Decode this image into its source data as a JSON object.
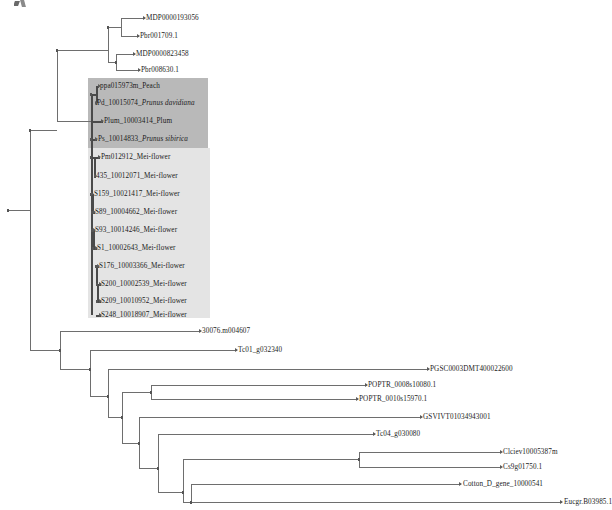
{
  "figure": {
    "kind": "phylogenetic-tree",
    "orientation": "rectangular-cladogram-left-to-right",
    "background": "#ffffff",
    "line_color": "#6e6e6e",
    "highlight_dark": "#b9b9b9",
    "highlight_light": "#e4e4e4"
  },
  "highlights": [
    {
      "name": "prunus-clade-highlight",
      "shade": "dark",
      "x": 88,
      "y": 78,
      "w": 120,
      "h": 70
    },
    {
      "name": "mei-flower-clade-highlight",
      "shade": "light",
      "x": 88,
      "y": 148,
      "w": 122,
      "h": 170
    }
  ],
  "leaves": [
    {
      "id": "l1",
      "label": "MDP0000193056",
      "species": "",
      "x": 146,
      "y": 18,
      "group": "none"
    },
    {
      "id": "l2",
      "label": "Pbr001709.1",
      "species": "",
      "x": 140,
      "y": 36,
      "group": "none"
    },
    {
      "id": "l3",
      "label": "MDP0000823458",
      "species": "",
      "x": 136,
      "y": 54,
      "group": "none"
    },
    {
      "id": "l4",
      "label": "Pbr008630.1",
      "species": "",
      "x": 141,
      "y": 70,
      "group": "none"
    },
    {
      "id": "l5",
      "label": "ppa015973m_Peach",
      "species": "",
      "x": 100,
      "y": 86,
      "group": "prunus"
    },
    {
      "id": "l6",
      "label": "Pd_10015074_",
      "species": "Prunus davidiana",
      "x": 97,
      "y": 103,
      "group": "prunus"
    },
    {
      "id": "l7",
      "label": "Plum_10003414_Plum",
      "species": "",
      "x": 104,
      "y": 121,
      "group": "prunus"
    },
    {
      "id": "l8",
      "label": "Ps_10014833_",
      "species": "Prunus sibirica",
      "x": 98,
      "y": 139,
      "group": "prunus"
    },
    {
      "id": "l9",
      "label": "Pm012912_Mei-flower",
      "species": "",
      "x": 101,
      "y": 157,
      "group": "mei"
    },
    {
      "id": "l10",
      "label": "435_10012071_Mei-flower",
      "species": "",
      "x": 96,
      "y": 176,
      "group": "mei"
    },
    {
      "id": "l11",
      "label": "S159_10021417_Mei-flower",
      "species": "",
      "x": 94,
      "y": 194,
      "group": "mei"
    },
    {
      "id": "l12",
      "label": "S89_10004662_Mei-flower",
      "species": "",
      "x": 95,
      "y": 212,
      "group": "mei"
    },
    {
      "id": "l13",
      "label": "S93_10014246_Mei-flower",
      "species": "",
      "x": 95,
      "y": 230,
      "group": "mei"
    },
    {
      "id": "l14",
      "label": "S1_10002643_Mei-flower",
      "species": "",
      "x": 97,
      "y": 248,
      "group": "mei"
    },
    {
      "id": "l15",
      "label": "S176_10003366_Mei-flower",
      "species": "",
      "x": 99,
      "y": 266,
      "group": "mei"
    },
    {
      "id": "l16",
      "label": "S200_10002539_Mei-flower",
      "species": "",
      "x": 101,
      "y": 284,
      "group": "mei"
    },
    {
      "id": "l17",
      "label": "S209_10010952_Mei-flower",
      "species": "",
      "x": 101,
      "y": 301,
      "group": "mei"
    },
    {
      "id": "l18",
      "label": "S248_10018907_Mei-flower",
      "species": "",
      "x": 101,
      "y": 315,
      "group": "mei"
    },
    {
      "id": "l19",
      "label": "30076.m004607",
      "species": "",
      "x": 202,
      "y": 331,
      "group": "none"
    },
    {
      "id": "l20",
      "label": "Tc01_g032340",
      "species": "",
      "x": 238,
      "y": 350,
      "group": "none"
    },
    {
      "id": "l21",
      "label": "PGSC0003DMT400022600",
      "species": "",
      "x": 430,
      "y": 369,
      "group": "none"
    },
    {
      "id": "l22",
      "label": "POPTR_0008s10080.1",
      "species": "",
      "x": 368,
      "y": 385,
      "group": "none"
    },
    {
      "id": "l23",
      "label": "POPTR_0010s15970.1",
      "species": "",
      "x": 359,
      "y": 399,
      "group": "none"
    },
    {
      "id": "l24",
      "label": "GSVIVT01034943001",
      "species": "",
      "x": 423,
      "y": 417,
      "group": "none"
    },
    {
      "id": "l25",
      "label": "Tc04_g030080",
      "species": "",
      "x": 376,
      "y": 434,
      "group": "none"
    },
    {
      "id": "l26",
      "label": "Clciev10005387m",
      "species": "",
      "x": 503,
      "y": 452,
      "group": "none"
    },
    {
      "id": "l27",
      "label": "Cs9g01750.1",
      "species": "",
      "x": 503,
      "y": 467,
      "group": "none"
    },
    {
      "id": "l28",
      "label": "Cotton_D_gene_10000541",
      "species": "",
      "x": 463,
      "y": 484,
      "group": "none"
    },
    {
      "id": "l29",
      "label": "Eucgr.B03985.1",
      "species": "",
      "x": 564,
      "y": 502,
      "group": "none"
    }
  ],
  "edges": {
    "note": "rectangular cladogram: horizontal branch segments plus vertical connectors",
    "horizontal": [
      {
        "x": 8,
        "y": 210,
        "w": 22,
        "thick": false,
        "name": "root-stem"
      },
      {
        "x": 30,
        "y": 130,
        "w": 27,
        "thick": false,
        "name": "rosaceae-stem"
      },
      {
        "x": 57,
        "y": 50,
        "w": 51,
        "thick": false,
        "name": "malus-pyrus-stem"
      },
      {
        "x": 108,
        "y": 27,
        "w": 13,
        "thick": false,
        "name": "mdp193056-pbr1709-node"
      },
      {
        "x": 121,
        "y": 18,
        "w": 24,
        "thick": false,
        "name": "branch-l1"
      },
      {
        "x": 121,
        "y": 36,
        "w": 18,
        "thick": false,
        "name": "branch-l2"
      },
      {
        "x": 108,
        "y": 62,
        "w": 8,
        "thick": false,
        "name": "mdp823458-pbr8630-node"
      },
      {
        "x": 116,
        "y": 54,
        "w": 19,
        "thick": false,
        "name": "branch-l3"
      },
      {
        "x": 116,
        "y": 70,
        "w": 24,
        "thick": false,
        "name": "branch-l4"
      },
      {
        "x": 57,
        "y": 121,
        "w": 34,
        "thick": false,
        "name": "prunus-stem"
      },
      {
        "x": 91,
        "y": 94,
        "w": 5,
        "thick": true,
        "name": "peach-davidiana-node"
      },
      {
        "x": 96,
        "y": 86,
        "w": 3,
        "thick": true,
        "name": "branch-l5"
      },
      {
        "x": 96,
        "y": 103,
        "w": 1,
        "thick": true,
        "name": "branch-l6"
      },
      {
        "x": 91,
        "y": 121,
        "w": 12,
        "thick": true,
        "name": "branch-l7"
      },
      {
        "x": 91,
        "y": 139,
        "w": 6,
        "thick": true,
        "name": "branch-l8"
      },
      {
        "x": 91,
        "y": 157,
        "w": 9,
        "thick": true,
        "name": "branch-l9"
      },
      {
        "x": 94,
        "y": 176,
        "w": 2,
        "thick": true,
        "name": "branch-l10"
      },
      {
        "x": 91,
        "y": 194,
        "w": 2,
        "thick": true,
        "name": "branch-l11"
      },
      {
        "x": 92,
        "y": 212,
        "w": 3,
        "thick": true,
        "name": "branch-l12"
      },
      {
        "x": 92,
        "y": 230,
        "w": 3,
        "thick": true,
        "name": "branch-l13"
      },
      {
        "x": 93,
        "y": 248,
        "w": 4,
        "thick": true,
        "name": "branch-l14"
      },
      {
        "x": 96,
        "y": 266,
        "w": 3,
        "thick": true,
        "name": "branch-l15"
      },
      {
        "x": 97,
        "y": 284,
        "w": 4,
        "thick": true,
        "name": "branch-l16"
      },
      {
        "x": 97,
        "y": 301,
        "w": 4,
        "thick": true,
        "name": "branch-l17"
      },
      {
        "x": 96,
        "y": 315,
        "w": 5,
        "thick": true,
        "name": "branch-l18"
      },
      {
        "x": 30,
        "y": 350,
        "w": 30,
        "thick": false,
        "name": "outgroup-stem"
      },
      {
        "x": 60,
        "y": 331,
        "w": 141,
        "thick": false,
        "name": "branch-l19"
      },
      {
        "x": 60,
        "y": 369,
        "w": 30,
        "thick": false,
        "name": "rosid-stem"
      },
      {
        "x": 90,
        "y": 350,
        "w": 147,
        "thick": false,
        "name": "branch-l20"
      },
      {
        "x": 90,
        "y": 396,
        "w": 18,
        "thick": false,
        "name": "malvid-fabid-stem"
      },
      {
        "x": 108,
        "y": 369,
        "w": 321,
        "thick": false,
        "name": "branch-l21"
      },
      {
        "x": 108,
        "y": 417,
        "w": 14,
        "thick": false,
        "name": "node-poptr-rest"
      },
      {
        "x": 122,
        "y": 392,
        "w": 29,
        "thick": false,
        "name": "poptr-node"
      },
      {
        "x": 151,
        "y": 385,
        "w": 216,
        "thick": false,
        "name": "branch-l22"
      },
      {
        "x": 151,
        "y": 399,
        "w": 207,
        "thick": false,
        "name": "branch-l23"
      },
      {
        "x": 122,
        "y": 443,
        "w": 17,
        "thick": false,
        "name": "node-vitis-rest"
      },
      {
        "x": 139,
        "y": 417,
        "w": 283,
        "thick": false,
        "name": "branch-l24"
      },
      {
        "x": 139,
        "y": 468,
        "w": 19,
        "thick": false,
        "name": "node-tc04-rest"
      },
      {
        "x": 158,
        "y": 434,
        "w": 217,
        "thick": false,
        "name": "branch-l25"
      },
      {
        "x": 158,
        "y": 492,
        "w": 25,
        "thick": false,
        "name": "node-lower"
      },
      {
        "x": 183,
        "y": 459,
        "w": 176,
        "thick": false,
        "name": "citrus-stem"
      },
      {
        "x": 359,
        "y": 452,
        "w": 142,
        "thick": false,
        "name": "branch-l26"
      },
      {
        "x": 359,
        "y": 467,
        "w": 142,
        "thick": false,
        "name": "branch-l27"
      },
      {
        "x": 183,
        "y": 502,
        "w": 8,
        "thick": false,
        "name": "node-cotton-eucgr"
      },
      {
        "x": 191,
        "y": 484,
        "w": 270,
        "thick": false,
        "name": "branch-l28"
      },
      {
        "x": 191,
        "y": 502,
        "w": 371,
        "thick": false,
        "name": "branch-l29"
      }
    ],
    "vertical": [
      {
        "x": 30,
        "y": 130,
        "h": 220,
        "thick": false,
        "name": "root-connector"
      },
      {
        "x": 57,
        "y": 50,
        "h": 71,
        "thick": false,
        "name": "rosaceae-connector"
      },
      {
        "x": 108,
        "y": 27,
        "h": 35,
        "thick": false,
        "name": "maleae-connector"
      },
      {
        "x": 121,
        "y": 18,
        "h": 18,
        "thick": false,
        "name": "mdp193056-connector"
      },
      {
        "x": 116,
        "y": 54,
        "h": 16,
        "thick": false,
        "name": "mdp823458-connector"
      },
      {
        "x": 91,
        "y": 94,
        "h": 221,
        "thick": true,
        "name": "prunus-backbone"
      },
      {
        "x": 96,
        "y": 86,
        "h": 17,
        "thick": true,
        "name": "peach-connector"
      },
      {
        "x": 94,
        "y": 157,
        "h": 19,
        "thick": true,
        "name": "pm-435-connector"
      },
      {
        "x": 92,
        "y": 194,
        "h": 18,
        "thick": true,
        "name": "s159-s89-connector"
      },
      {
        "x": 93,
        "y": 230,
        "h": 18,
        "thick": true,
        "name": "s93-s1-connector"
      },
      {
        "x": 96,
        "y": 266,
        "h": 18,
        "thick": true,
        "name": "s176-s200-connector"
      },
      {
        "x": 97,
        "y": 284,
        "h": 17,
        "thick": true,
        "name": "s200-s209-connector"
      },
      {
        "x": 60,
        "y": 331,
        "h": 38,
        "thick": false,
        "name": "outgroup-connector"
      },
      {
        "x": 90,
        "y": 350,
        "h": 46,
        "thick": false,
        "name": "rosid-connector"
      },
      {
        "x": 108,
        "y": 369,
        "h": 48,
        "thick": false,
        "name": "malvid-connector"
      },
      {
        "x": 151,
        "y": 385,
        "h": 14,
        "thick": false,
        "name": "poptr-connector"
      },
      {
        "x": 122,
        "y": 392,
        "h": 51,
        "thick": false,
        "name": "poptr-rest-connector"
      },
      {
        "x": 139,
        "y": 417,
        "h": 51,
        "thick": false,
        "name": "vitis-rest-connector"
      },
      {
        "x": 158,
        "y": 434,
        "h": 58,
        "thick": false,
        "name": "tc04-rest-connector"
      },
      {
        "x": 183,
        "y": 459,
        "h": 43,
        "thick": false,
        "name": "lower-connector"
      },
      {
        "x": 359,
        "y": 452,
        "h": 15,
        "thick": false,
        "name": "citrus-connector"
      },
      {
        "x": 191,
        "y": 484,
        "h": 18,
        "thick": false,
        "name": "cotton-eucgr-connector"
      }
    ]
  },
  "node_dots": [
    {
      "x": 107,
      "y": 26,
      "name": "node-maleae-a"
    },
    {
      "x": 115,
      "y": 61,
      "name": "node-maleae-b"
    },
    {
      "x": 56,
      "y": 49,
      "name": "node-rosaceae"
    },
    {
      "x": 29,
      "y": 129,
      "name": "node-root-a"
    },
    {
      "x": 7,
      "y": 209,
      "name": "node-root"
    },
    {
      "x": 90,
      "y": 93,
      "name": "node-peach-davidiana"
    },
    {
      "x": 90,
      "y": 138,
      "name": "node-sibirica"
    },
    {
      "x": 90,
      "y": 156,
      "name": "node-mei-a"
    },
    {
      "x": 90,
      "y": 193,
      "name": "node-mei-b"
    },
    {
      "x": 91,
      "y": 211,
      "name": "node-mei-c"
    },
    {
      "x": 91,
      "y": 229,
      "name": "node-mei-d"
    },
    {
      "x": 92,
      "y": 247,
      "name": "node-mei-e"
    },
    {
      "x": 95,
      "y": 265,
      "name": "node-mei-f"
    },
    {
      "x": 96,
      "y": 283,
      "name": "node-mei-g"
    },
    {
      "x": 96,
      "y": 300,
      "name": "node-mei-h"
    },
    {
      "x": 59,
      "y": 349,
      "name": "node-outgroup"
    },
    {
      "x": 89,
      "y": 368,
      "name": "node-rosid"
    },
    {
      "x": 107,
      "y": 395,
      "name": "node-malvid"
    },
    {
      "x": 150,
      "y": 391,
      "name": "node-poptr"
    },
    {
      "x": 121,
      "y": 416,
      "name": "node-vitis"
    },
    {
      "x": 138,
      "y": 442,
      "name": "node-tc04"
    },
    {
      "x": 157,
      "y": 467,
      "name": "node-lower-a"
    },
    {
      "x": 182,
      "y": 491,
      "name": "node-lower-b"
    },
    {
      "x": 358,
      "y": 458,
      "name": "node-citrus"
    },
    {
      "x": 190,
      "y": 501,
      "name": "node-cotton"
    }
  ],
  "tip_arrows": [
    {
      "x": 143,
      "y": 18
    },
    {
      "x": 137,
      "y": 36
    },
    {
      "x": 133,
      "y": 54
    },
    {
      "x": 138,
      "y": 70
    },
    {
      "x": 98,
      "y": 86
    },
    {
      "x": 95,
      "y": 103
    },
    {
      "x": 101,
      "y": 121
    },
    {
      "x": 95,
      "y": 139
    },
    {
      "x": 98,
      "y": 157
    },
    {
      "x": 94,
      "y": 176
    },
    {
      "x": 91,
      "y": 194
    },
    {
      "x": 93,
      "y": 212
    },
    {
      "x": 93,
      "y": 230
    },
    {
      "x": 95,
      "y": 248
    },
    {
      "x": 97,
      "y": 266
    },
    {
      "x": 99,
      "y": 284
    },
    {
      "x": 99,
      "y": 301
    },
    {
      "x": 99,
      "y": 315
    },
    {
      "x": 199,
      "y": 331
    },
    {
      "x": 235,
      "y": 350
    },
    {
      "x": 427,
      "y": 369
    },
    {
      "x": 365,
      "y": 385
    },
    {
      "x": 356,
      "y": 399
    },
    {
      "x": 420,
      "y": 417
    },
    {
      "x": 373,
      "y": 434
    },
    {
      "x": 500,
      "y": 452
    },
    {
      "x": 500,
      "y": 467
    },
    {
      "x": 459,
      "y": 484
    },
    {
      "x": 560,
      "y": 502
    }
  ],
  "artifacts": {
    "top_scrap": "partial-cropped-mark-top-left"
  }
}
